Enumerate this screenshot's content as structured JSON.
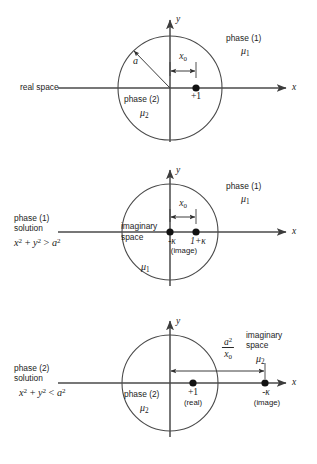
{
  "figure": {
    "background": "#ffffff",
    "line_color": "#3c3c3c",
    "text_color": "#1d1d1d"
  },
  "panels": [
    {
      "id": "panel-real-space",
      "caption": "real space",
      "caption_lines": [
        "real space"
      ],
      "equation": "",
      "circle": {
        "cx": 170,
        "cy": 66,
        "r": 52
      },
      "axes": {
        "x_label": "x",
        "y_label": "y"
      },
      "radius_arrow": {
        "label": "a"
      },
      "x0_arrow": {
        "label": "x",
        "label_sub": "0"
      },
      "inside_region": {
        "phase": "phase (2)",
        "mu": "μ",
        "mu_sub": "2"
      },
      "outside_region": {
        "phase": "phase (1)",
        "mu": "μ",
        "mu_sub": "1"
      },
      "charges": [
        {
          "name": "unit-charge",
          "label": "+1",
          "sublabel": "",
          "x": 196,
          "on_axis": true
        }
      ]
    },
    {
      "id": "panel-phase1-solution",
      "caption": "phase (1) solution",
      "caption_lines": [
        "phase (1)",
        "solution"
      ],
      "equation": "x² + y² > a²",
      "equation_parts": {
        "lhs_x": "x",
        "lhs_y": "y",
        "rel": ">",
        "rhs": "a",
        "exp": "2"
      },
      "circle": {
        "cx": 170,
        "cy": 232,
        "r": 48
      },
      "axes": {
        "x_label": "x",
        "y_label": "y"
      },
      "space_label": [
        "imaginary",
        "space"
      ],
      "x0_arrow": {
        "label": "x",
        "label_sub": "0"
      },
      "inside_region": {
        "phase": "",
        "mu": "μ",
        "mu_sub": "1"
      },
      "outside_region": {
        "phase": "phase (1)",
        "mu": "μ",
        "mu_sub": "1"
      },
      "charges": [
        {
          "name": "image-charge",
          "label": "-κ",
          "sublabel": "(image)",
          "x": 170,
          "on_axis": true
        },
        {
          "name": "source-charge",
          "label": "1+κ",
          "sublabel": "",
          "x": 196,
          "on_axis": true
        }
      ]
    },
    {
      "id": "panel-phase2-solution",
      "caption": "phase (2) solution",
      "caption_lines": [
        "phase (2)",
        "solution"
      ],
      "equation": "x² + y² < a²",
      "equation_parts": {
        "lhs_x": "x",
        "lhs_y": "y",
        "rel": "<",
        "rhs": "a",
        "exp": "2"
      },
      "circle": {
        "cx": 170,
        "cy": 383,
        "r": 48
      },
      "axes": {
        "x_label": "x",
        "y_label": "y"
      },
      "space_label": [
        "imaginary",
        "space"
      ],
      "distance_arrow": {
        "numerator": "a",
        "numerator_exp": "2",
        "denominator": "x",
        "denominator_sub": "0"
      },
      "inside_region": {
        "phase": "phase (2)",
        "mu": "μ",
        "mu_sub": "2"
      },
      "outside_region": {
        "phase": "",
        "mu": "μ",
        "mu_sub": "2"
      },
      "charges": [
        {
          "name": "real-charge",
          "label": "+1",
          "sublabel": "(real)",
          "x": 193,
          "on_axis": true
        },
        {
          "name": "image-charge",
          "label": "-κ",
          "sublabel": "(image)",
          "x": 265,
          "on_axis": true
        }
      ]
    }
  ],
  "symbols": {
    "mu": "μ",
    "kappa": "κ",
    "minus_kappa": "-κ",
    "one_plus_kappa": "1+κ",
    "plus_one": "+1",
    "radius": "a",
    "x_zero": "x",
    "x_zero_sub": "0",
    "image_note": "(image)",
    "real_note": "(real)",
    "imaginary": "imaginary",
    "space": "space",
    "phase1": "phase (1)",
    "phase2": "phase (2)",
    "solution": "solution",
    "real_space": "real space",
    "axis_x": "x",
    "axis_y": "y",
    "gt": ">",
    "lt": "<",
    "plus": "+",
    "exp2": "2"
  }
}
